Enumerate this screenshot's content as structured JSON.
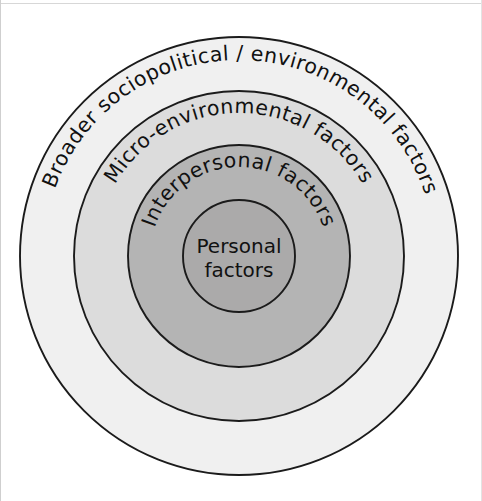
{
  "figure": {
    "type": "concentric-circles",
    "background_color": "#ffffff",
    "outline_color": "#1b1b1b",
    "text_color": "#111111"
  },
  "rings": [
    {
      "index": 1,
      "level": "outer",
      "label": "Broader sociopolitical / environmental factors",
      "fill_color": "#f0f0f0",
      "radius": 219,
      "label_radius": 196,
      "label_font_size": 20.5
    },
    {
      "index": 2,
      "level": "second",
      "label": "Micro-environmental  factors",
      "fill_color": "#dcdcdc",
      "radius": 165,
      "label_radius": 143,
      "label_font_size": 20.5
    },
    {
      "index": 3,
      "level": "third",
      "label": "Interpersonal  factors",
      "fill_color": "#b4b4b4",
      "radius": 111,
      "label_radius": 89,
      "label_font_size": 20.5
    },
    {
      "index": 4,
      "level": "core",
      "label_line_1": "Personal",
      "label_line_2": "factors",
      "fill_color": "#abaaaa",
      "radius": 56,
      "label_font_size": 20
    }
  ],
  "geometry": {
    "center_x": 239,
    "center_y": 256,
    "canvas_width": 482,
    "canvas_height": 501
  }
}
